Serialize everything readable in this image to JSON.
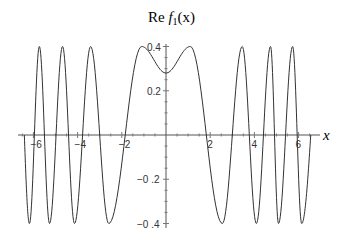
{
  "chart_data": {
    "type": "line",
    "title": "Re f1(x)",
    "title_parts": {
      "prefix": "Re ",
      "func": "f",
      "subscript": "1",
      "arg": "(x)"
    },
    "xlabel": "x",
    "ylabel": "",
    "xlim": [
      -6.7,
      7.0
    ],
    "ylim": [
      -0.4,
      0.4
    ],
    "x_ticks": [
      -6,
      -4,
      -2,
      2,
      4,
      6
    ],
    "x_tick_labels": [
      "-6",
      "-4",
      "-2",
      "2",
      "4",
      "6"
    ],
    "y_ticks": [
      0.4,
      0.2,
      -0.2,
      -0.4
    ],
    "y_tick_labels": [
      "0.4",
      "0.2",
      "-0.2",
      "-0.4"
    ],
    "grid": false,
    "legend": null,
    "line_color": "#333333",
    "series": [
      {
        "name": "Re f1(x)",
        "extrema": [
          [
            -6.41,
            0.0
          ],
          [
            -6.18,
            -0.4
          ],
          [
            -5.73,
            0.4
          ],
          [
            -5.27,
            -0.4
          ],
          [
            -4.68,
            0.4
          ],
          [
            -4.14,
            -0.4
          ],
          [
            -3.41,
            0.4
          ],
          [
            -2.59,
            -0.4
          ],
          [
            -1.1,
            0.4
          ],
          [
            0.0,
            0.28
          ],
          [
            1.1,
            0.4
          ],
          [
            2.55,
            -0.4
          ],
          [
            3.45,
            0.4
          ],
          [
            4.09,
            -0.4
          ],
          [
            4.73,
            0.4
          ],
          [
            5.09,
            -0.4
          ],
          [
            5.73,
            0.4
          ],
          [
            6.14,
            -0.4
          ],
          [
            6.55,
            0.0
          ]
        ]
      }
    ]
  },
  "axes": {
    "origin_px": [
      166,
      135
    ],
    "px_per_x": 22.1,
    "px_per_y": 221.25
  }
}
